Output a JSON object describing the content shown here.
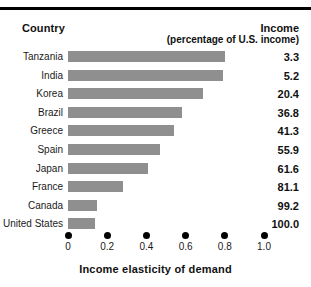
{
  "header": {
    "country_label": "Country",
    "income_label": "Income",
    "income_sublabel": "(percentage of U.S. income)"
  },
  "axis": {
    "title": "Income elasticity of demand",
    "ticks": [
      "0",
      "0.2",
      "0.4",
      "0.6",
      "0.8",
      "1.0"
    ]
  },
  "chart_data": {
    "type": "bar",
    "orientation": "horizontal",
    "title": "",
    "xlabel": "Income elasticity of demand",
    "ylabel": "Country",
    "xlim": [
      0,
      1.0
    ],
    "xticks": [
      0,
      0.2,
      0.4,
      0.6,
      0.8,
      1.0
    ],
    "grid": false,
    "legend": false,
    "bar_color": "#8f8f8f",
    "categories": [
      "Tanzania",
      "India",
      "Korea",
      "Brazil",
      "Greece",
      "Spain",
      "Japan",
      "France",
      "Canada",
      "United States"
    ],
    "values": [
      0.8,
      0.79,
      0.69,
      0.58,
      0.54,
      0.47,
      0.41,
      0.28,
      0.15,
      0.14
    ],
    "annotations_column": {
      "header": "Income",
      "subheader": "(percentage of U.S. income)",
      "values": [
        "3.3",
        "5.2",
        "20.4",
        "36.8",
        "41.3",
        "55.9",
        "61.6",
        "81.1",
        "99.2",
        "100.0"
      ]
    }
  }
}
